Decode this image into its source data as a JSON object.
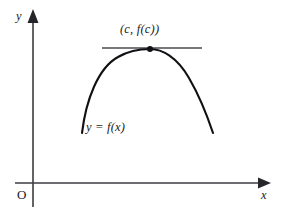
{
  "figure": {
    "type": "calculus-diagram",
    "background_color": "#ffffff",
    "curve_color": "#111115",
    "axis_color": "#3d3d42",
    "tangent_color": "#4a4a50"
  },
  "axes": {
    "y_axis_label": "y",
    "x_axis_label": "x",
    "origin_label": "O",
    "x_axis_y_px": 183,
    "y_axis_x_px": 33,
    "x_axis_start_px": 15,
    "x_axis_end_px": 268,
    "y_axis_top_px": 12,
    "y_axis_bottom_px": 207
  },
  "curve": {
    "function_label": "y = f(x)",
    "left_end": {
      "x": 82,
      "y": 133
    },
    "vertex": {
      "x": 150,
      "y": 49
    },
    "right_end": {
      "x": 213,
      "y": 133
    }
  },
  "tangent_line": {
    "y_px": 48,
    "x_start_px": 102,
    "x_end_px": 202
  },
  "critical_point": {
    "label": "(c, f(c))",
    "x_px": 150,
    "y_px": 49,
    "dot_radius_px": 3
  }
}
